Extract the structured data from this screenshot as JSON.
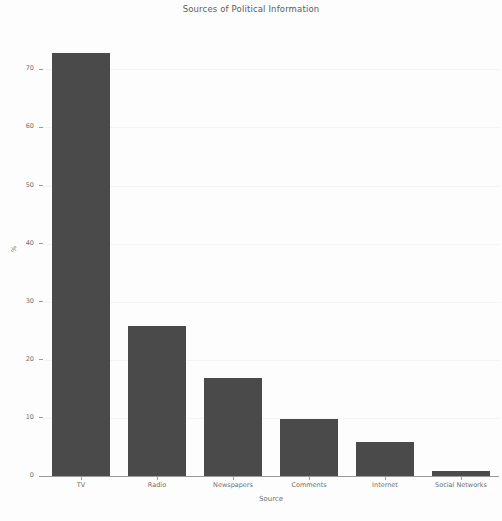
{
  "chart_data": {
    "type": "bar",
    "title": "Sources of Political Information",
    "xlabel": "Source",
    "ylabel": "%",
    "categories": [
      "TV",
      "Radio",
      "Newspapers",
      "Comments",
      "Internet",
      "Social Networks"
    ],
    "values": [
      73,
      26,
      17,
      10,
      6,
      1
    ],
    "ylim": [
      0,
      75
    ],
    "yticks": [
      0,
      10,
      20,
      30,
      40,
      50,
      60,
      70
    ],
    "ytick_labels": [
      "0",
      "10",
      "20",
      "30",
      "40",
      "50",
      "60",
      "70"
    ],
    "grid": true,
    "legend": null,
    "series": [
      {
        "name": "%",
        "values": [
          73,
          26,
          17,
          10,
          6,
          1
        ],
        "color": "#4a4a4a"
      }
    ],
    "colors": {
      "bar": "#4a4a4a",
      "background": "#fdfdfd",
      "grid": "#f4f4f4",
      "axis": "#9a9a9a",
      "text": "#6e6e6e",
      "title_text": "#5c5c5c"
    }
  }
}
